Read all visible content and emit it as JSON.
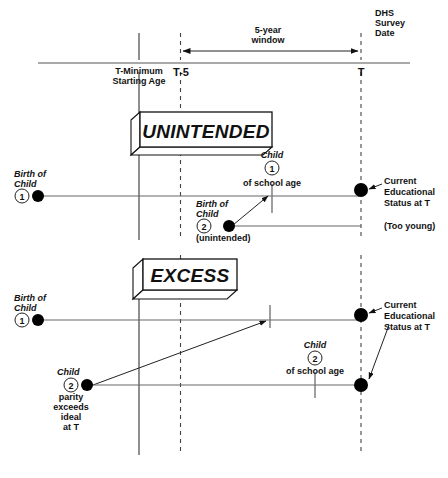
{
  "figure": {
    "colors": {
      "ink": "#111111",
      "line": "#666666",
      "axis": "#555555",
      "background": "#ffffff"
    }
  },
  "timeline": {
    "survey_label_lines": [
      "DHS",
      "Survey",
      "Date"
    ],
    "window_label_lines": [
      "5-year",
      "window"
    ],
    "ticks": [
      {
        "id": "t-minimum",
        "lines": [
          "T-Minimum",
          "Starting Age"
        ],
        "style": "solid"
      },
      {
        "id": "t-minus-5",
        "lines": [
          "T-5"
        ],
        "style": "dashed"
      },
      {
        "id": "t",
        "lines": [
          "T"
        ],
        "style": "dashed"
      }
    ]
  },
  "panels": [
    {
      "id": "unintended",
      "banner": "UNINTENDED",
      "events": [
        {
          "id": "birth-child-1",
          "lines": [
            "Birth of",
            "Child"
          ],
          "number": "1",
          "marker": "filled-dot"
        },
        {
          "id": "child-1-school-age",
          "lines_above": [
            "Child"
          ],
          "number": "1",
          "lines_below": [
            "of school age"
          ],
          "marker": "tick"
        },
        {
          "id": "birth-child-2",
          "lines_above": [
            "Birth of",
            "Child"
          ],
          "number": "2",
          "lines_below": [
            "(unintended)"
          ],
          "marker": "filled-dot"
        },
        {
          "id": "current-status-1",
          "lines": [
            "Current",
            "Educational",
            "Status at T"
          ],
          "marker": "filled-dot"
        },
        {
          "id": "too-young-note",
          "lines": [
            "(Too young)"
          ],
          "marker": "none"
        }
      ]
    },
    {
      "id": "excess",
      "banner": "EXCESS",
      "events": [
        {
          "id": "birth-child-1",
          "lines": [
            "Birth of",
            "Child"
          ],
          "number": "1",
          "marker": "filled-dot"
        },
        {
          "id": "child-2-parity",
          "lines_above": [
            "Child"
          ],
          "number": "2",
          "lines_below": [
            "parity",
            "exceeds",
            "ideal",
            "at T"
          ],
          "marker": "filled-dot"
        },
        {
          "id": "child-2-school-age",
          "lines_above": [
            "Child"
          ],
          "number": "2",
          "lines_below": [
            "of school age"
          ],
          "marker": "tick"
        },
        {
          "id": "current-status-2",
          "lines": [
            "Current",
            "Educational",
            "Status at T"
          ],
          "marker": "filled-dot"
        }
      ]
    }
  ],
  "text": {
    "dhs": "DHS",
    "survey": "Survey",
    "date": "Date",
    "five_year": "5-year",
    "window": "window",
    "t_minimum": "T-Minimum",
    "starting_age": "Starting Age",
    "t_minus_5": "T-5",
    "t": "T",
    "unintended_banner": "UNINTENDED",
    "excess_banner": "EXCESS",
    "birth_of": "Birth of",
    "child": "Child",
    "child_italic": "Child",
    "of_school_age": "of school age",
    "unintended_paren": "(unintended)",
    "too_young": "(Too young)",
    "current": "Current",
    "educational": "Educational",
    "status_at_t": "Status at T",
    "parity": "parity",
    "exceeds": "exceeds",
    "ideal": "ideal",
    "at_t": "at T",
    "num_one": "1",
    "num_two": "2"
  }
}
